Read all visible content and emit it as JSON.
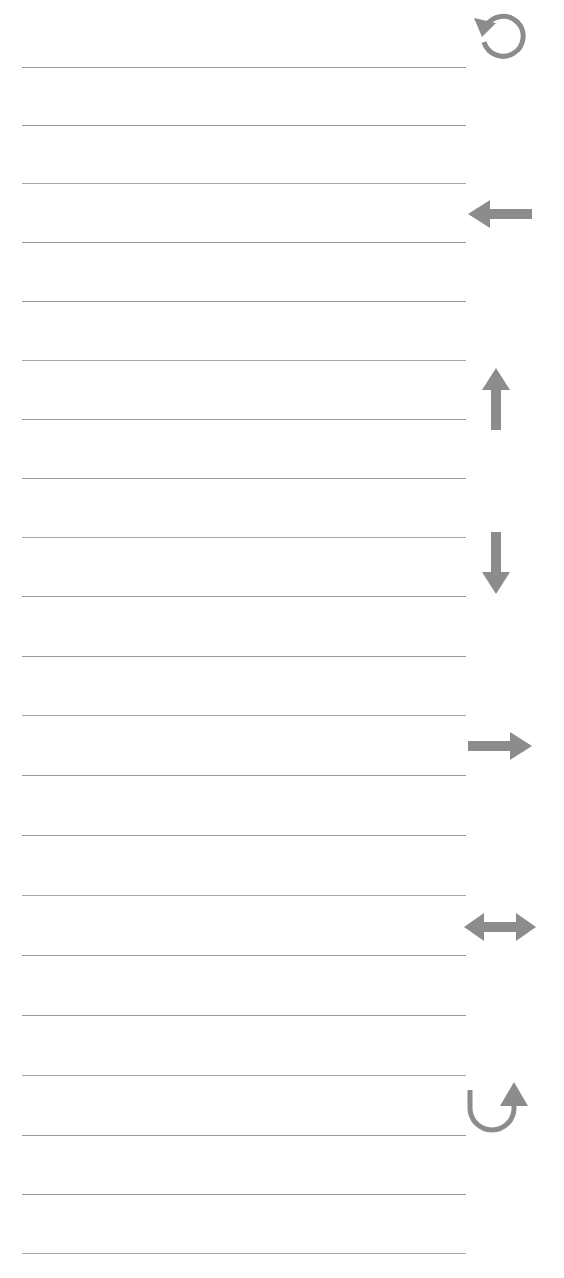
{
  "page": {
    "kind": "ruled-notebook-page",
    "width": 564,
    "height": 1278,
    "background_color": "#ffffff",
    "rule_color": "#9a9a9a",
    "glyph_color": "#8c8c8c",
    "rule_left_x": 22,
    "rule_right_x": 466,
    "rule_count": 21
  },
  "rules": [
    {
      "name": "rule-line-1",
      "y": 67,
      "x1": 22,
      "x2": 466
    },
    {
      "name": "rule-line-2",
      "y": 125,
      "x1": 22,
      "x2": 466
    },
    {
      "name": "rule-line-3",
      "y": 183,
      "x1": 22,
      "x2": 466
    },
    {
      "name": "rule-line-4",
      "y": 242,
      "x1": 22,
      "x2": 466
    },
    {
      "name": "rule-line-5",
      "y": 301,
      "x1": 22,
      "x2": 466
    },
    {
      "name": "rule-line-6",
      "y": 360,
      "x1": 22,
      "x2": 466
    },
    {
      "name": "rule-line-7",
      "y": 419,
      "x1": 22,
      "x2": 466
    },
    {
      "name": "rule-line-8",
      "y": 478,
      "x1": 22,
      "x2": 466
    },
    {
      "name": "rule-line-9",
      "y": 537,
      "x1": 22,
      "x2": 466
    },
    {
      "name": "rule-line-10",
      "y": 596,
      "x1": 22,
      "x2": 466
    },
    {
      "name": "rule-line-11",
      "y": 656,
      "x1": 22,
      "x2": 466
    },
    {
      "name": "rule-line-12",
      "y": 715,
      "x1": 22,
      "x2": 466
    },
    {
      "name": "rule-line-13",
      "y": 775,
      "x1": 22,
      "x2": 466
    },
    {
      "name": "rule-line-14",
      "y": 835,
      "x1": 22,
      "x2": 466
    },
    {
      "name": "rule-line-15",
      "y": 895,
      "x1": 22,
      "x2": 466
    },
    {
      "name": "rule-line-16",
      "y": 955,
      "x1": 22,
      "x2": 466
    },
    {
      "name": "rule-line-17",
      "y": 1015,
      "x1": 22,
      "x2": 466
    },
    {
      "name": "rule-line-18",
      "y": 1075,
      "x1": 22,
      "x2": 466
    },
    {
      "name": "rule-line-19",
      "y": 1135,
      "x1": 22,
      "x2": 466
    },
    {
      "name": "rule-line-20",
      "y": 1194,
      "x1": 22,
      "x2": 466
    },
    {
      "name": "rule-line-21",
      "y": 1253,
      "x1": 22,
      "x2": 466
    }
  ],
  "glyphs": [
    {
      "name": "rotate-counterclockwise-icon",
      "label": "rotate counter-clockwise",
      "shape": "circular-arrow-ccw",
      "x": 470,
      "y": 6,
      "width": 64,
      "height": 60
    },
    {
      "name": "arrow-left-icon",
      "label": "arrow left",
      "shape": "arrow-left",
      "x": 468,
      "y": 196,
      "width": 64,
      "height": 36
    },
    {
      "name": "arrow-up-icon",
      "label": "arrow up",
      "shape": "arrow-up",
      "x": 478,
      "y": 368,
      "width": 36,
      "height": 62
    },
    {
      "name": "arrow-down-icon",
      "label": "arrow down",
      "shape": "arrow-down",
      "x": 478,
      "y": 532,
      "width": 36,
      "height": 62
    },
    {
      "name": "arrow-right-icon",
      "label": "arrow right",
      "shape": "arrow-right",
      "x": 468,
      "y": 728,
      "width": 64,
      "height": 36
    },
    {
      "name": "arrow-left-right-icon",
      "label": "arrow left right",
      "shape": "arrow-left-right",
      "x": 464,
      "y": 908,
      "width": 72,
      "height": 38
    },
    {
      "name": "arrow-curve-up-right-icon",
      "label": "curved arrow up right",
      "shape": "curve-arrow-up-right",
      "x": 462,
      "y": 1082,
      "width": 68,
      "height": 56
    }
  ]
}
